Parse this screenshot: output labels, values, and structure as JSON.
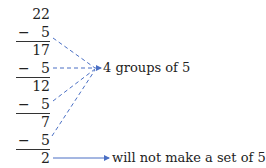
{
  "subtraction": {
    "start": "22",
    "steps": [
      {
        "operator": "−",
        "subtrahend": "5",
        "result": "17"
      },
      {
        "operator": "−",
        "subtrahend": "5",
        "result": "12"
      },
      {
        "operator": "−",
        "subtrahend": "5",
        "result": "7"
      },
      {
        "operator": "−",
        "subtrahend": "5",
        "result": "2"
      }
    ]
  },
  "annotations": {
    "groups_label": "4 groups of 5",
    "remainder_label": "will not make a set of 5"
  },
  "colors": {
    "arrow": "#4a6fc4",
    "text": "#222222"
  }
}
